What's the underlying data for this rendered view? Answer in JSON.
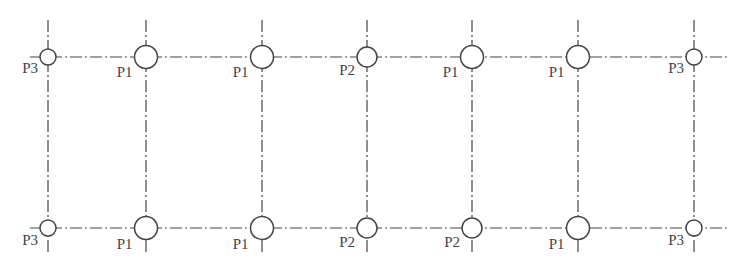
{
  "diagram": {
    "type": "pile-layout-grid",
    "rows": [
      {
        "name": "top-row",
        "points": [
          {
            "label": "P3",
            "size": "small"
          },
          {
            "label": "P1",
            "size": "large"
          },
          {
            "label": "P1",
            "size": "large"
          },
          {
            "label": "P2",
            "size": "medium"
          },
          {
            "label": "P1",
            "size": "large"
          },
          {
            "label": "P1",
            "size": "large"
          },
          {
            "label": "P3",
            "size": "small"
          }
        ]
      },
      {
        "name": "bottom-row",
        "points": [
          {
            "label": "P3",
            "size": "small"
          },
          {
            "label": "P1",
            "size": "large"
          },
          {
            "label": "P1",
            "size": "large"
          },
          {
            "label": "P2",
            "size": "medium"
          },
          {
            "label": "P2",
            "size": "medium"
          },
          {
            "label": "P1",
            "size": "large"
          },
          {
            "label": "P3",
            "size": "small"
          }
        ]
      }
    ],
    "line_color": "#444444"
  }
}
